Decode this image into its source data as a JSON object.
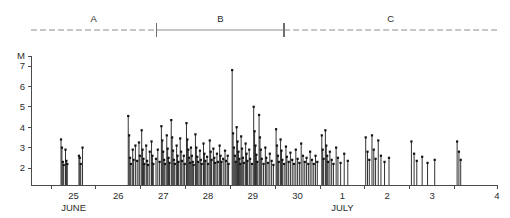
{
  "chart_data": {
    "type": "scatter",
    "title": "",
    "subtitle": "",
    "xlabel": "",
    "ylabel": "M",
    "ylim": [
      1.6,
      7.6
    ],
    "xlim": [
      24.55,
      4.95
    ],
    "grid": false,
    "legend": null,
    "y_ticks": [
      7,
      6,
      5,
      4,
      3,
      2
    ],
    "y_tick_labels": [
      "7",
      "6",
      "5",
      "4",
      "3",
      "2"
    ],
    "x_ticks": [
      25,
      26,
      27,
      28,
      29,
      30,
      1,
      2,
      3,
      4
    ],
    "x_tick_labels": [
      "25",
      "26",
      "27",
      "28",
      "29",
      "30",
      "1",
      "2",
      "3",
      "4"
    ],
    "x_month_labels": [
      {
        "text": "JUNE",
        "at_tick": "25"
      },
      {
        "text": "JULY",
        "at_tick": "1"
      }
    ],
    "annotations": [
      {
        "label": "A",
        "style": "dashed",
        "start_day": 24.55,
        "end_day": 27.35
      },
      {
        "label": "B",
        "style": "solid",
        "start_day": 27.35,
        "end_day": 30.2
      },
      {
        "label": "C",
        "style": "dashed",
        "start_day": 30.2,
        "end_day": 4.95
      }
    ],
    "series": [
      {
        "name": "earthquake magnitudes",
        "marker": "square",
        "stem": true,
        "points": [
          [
            25.22,
            3.4
          ],
          [
            25.24,
            3.0
          ],
          [
            25.26,
            2.3
          ],
          [
            25.28,
            2.15
          ],
          [
            25.32,
            2.9
          ],
          [
            25.34,
            2.35
          ],
          [
            25.36,
            2.2
          ],
          [
            25.62,
            2.6
          ],
          [
            25.64,
            2.5
          ],
          [
            25.66,
            2.2
          ],
          [
            25.7,
            3.0
          ],
          [
            26.72,
            4.55
          ],
          [
            26.74,
            3.6
          ],
          [
            26.76,
            2.5
          ],
          [
            26.78,
            2.2
          ],
          [
            26.82,
            2.9
          ],
          [
            26.84,
            2.4
          ],
          [
            26.88,
            3.1
          ],
          [
            26.92,
            2.35
          ],
          [
            26.96,
            3.25
          ],
          [
            26.98,
            2.6
          ],
          [
            27.02,
            3.85
          ],
          [
            27.04,
            2.9
          ],
          [
            27.06,
            2.45
          ],
          [
            27.08,
            2.2
          ],
          [
            27.12,
            3.1
          ],
          [
            27.14,
            2.35
          ],
          [
            27.16,
            2.15
          ],
          [
            27.2,
            2.8
          ],
          [
            27.24,
            3.3
          ],
          [
            27.26,
            2.6
          ],
          [
            27.28,
            2.2
          ],
          [
            27.34,
            2.45
          ],
          [
            27.38,
            2.9
          ],
          [
            27.42,
            2.3
          ],
          [
            27.46,
            4.05
          ],
          [
            27.48,
            3.35
          ],
          [
            27.5,
            2.8
          ],
          [
            27.52,
            2.4
          ],
          [
            27.54,
            2.2
          ],
          [
            27.58,
            3.6
          ],
          [
            27.6,
            2.95
          ],
          [
            27.62,
            2.5
          ],
          [
            27.64,
            2.25
          ],
          [
            27.68,
            4.35
          ],
          [
            27.7,
            3.5
          ],
          [
            27.72,
            2.85
          ],
          [
            27.74,
            2.4
          ],
          [
            27.76,
            2.2
          ],
          [
            27.8,
            3.1
          ],
          [
            27.82,
            2.6
          ],
          [
            27.84,
            2.3
          ],
          [
            27.88,
            3.45
          ],
          [
            27.9,
            2.8
          ],
          [
            27.92,
            2.35
          ],
          [
            27.96,
            2.6
          ],
          [
            27.98,
            2.2
          ],
          [
            28.02,
            4.2
          ],
          [
            28.04,
            3.4
          ],
          [
            28.06,
            2.9
          ],
          [
            28.08,
            2.5
          ],
          [
            28.1,
            2.25
          ],
          [
            28.12,
            3.0
          ],
          [
            28.14,
            2.6
          ],
          [
            28.16,
            2.3
          ],
          [
            28.18,
            2.15
          ],
          [
            28.22,
            3.65
          ],
          [
            28.24,
            3.0
          ],
          [
            28.26,
            2.55
          ],
          [
            28.28,
            2.3
          ],
          [
            28.32,
            2.85
          ],
          [
            28.34,
            2.4
          ],
          [
            28.36,
            2.2
          ],
          [
            28.4,
            3.2
          ],
          [
            28.42,
            2.7
          ],
          [
            28.44,
            2.35
          ],
          [
            28.48,
            2.55
          ],
          [
            28.5,
            2.2
          ],
          [
            28.54,
            3.35
          ],
          [
            28.56,
            2.8
          ],
          [
            28.58,
            2.4
          ],
          [
            28.62,
            2.95
          ],
          [
            28.64,
            2.5
          ],
          [
            28.66,
            2.25
          ],
          [
            28.7,
            2.7
          ],
          [
            28.72,
            2.3
          ],
          [
            28.76,
            3.1
          ],
          [
            28.78,
            2.6
          ],
          [
            28.8,
            2.3
          ],
          [
            28.84,
            2.45
          ],
          [
            28.88,
            2.85
          ],
          [
            28.9,
            2.35
          ],
          [
            28.94,
            2.6
          ],
          [
            28.96,
            2.2
          ],
          [
            29.04,
            6.8
          ],
          [
            29.06,
            3.7
          ],
          [
            29.08,
            3.0
          ],
          [
            29.1,
            2.6
          ],
          [
            29.12,
            2.3
          ],
          [
            29.14,
            4.0
          ],
          [
            29.16,
            3.3
          ],
          [
            29.18,
            2.8
          ],
          [
            29.2,
            2.45
          ],
          [
            29.22,
            2.2
          ],
          [
            29.24,
            3.55
          ],
          [
            29.26,
            2.95
          ],
          [
            29.28,
            2.5
          ],
          [
            29.3,
            2.25
          ],
          [
            29.34,
            3.2
          ],
          [
            29.36,
            2.7
          ],
          [
            29.38,
            2.35
          ],
          [
            29.42,
            2.9
          ],
          [
            29.44,
            2.45
          ],
          [
            29.48,
            2.2
          ],
          [
            29.52,
            5.0
          ],
          [
            29.54,
            3.8
          ],
          [
            29.56,
            3.1
          ],
          [
            29.58,
            2.65
          ],
          [
            29.6,
            2.3
          ],
          [
            29.64,
            4.6
          ],
          [
            29.66,
            3.5
          ],
          [
            29.68,
            2.9
          ],
          [
            29.7,
            2.45
          ],
          [
            29.74,
            2.2
          ],
          [
            29.78,
            3.0
          ],
          [
            29.8,
            2.5
          ],
          [
            29.84,
            2.25
          ],
          [
            29.88,
            2.7
          ],
          [
            29.92,
            2.35
          ],
          [
            29.96,
            2.15
          ],
          [
            30.02,
            3.9
          ],
          [
            30.04,
            3.1
          ],
          [
            30.06,
            2.6
          ],
          [
            30.08,
            2.3
          ],
          [
            30.12,
            3.4
          ],
          [
            30.14,
            2.85
          ],
          [
            30.16,
            2.4
          ],
          [
            30.2,
            2.2
          ],
          [
            30.24,
            3.05
          ],
          [
            30.26,
            2.55
          ],
          [
            30.3,
            2.3
          ],
          [
            30.34,
            2.75
          ],
          [
            30.38,
            2.4
          ],
          [
            30.42,
            2.2
          ],
          [
            30.46,
            2.9
          ],
          [
            30.5,
            2.45
          ],
          [
            30.54,
            2.25
          ],
          [
            30.58,
            3.2
          ],
          [
            30.62,
            2.6
          ],
          [
            30.66,
            2.3
          ],
          [
            30.7,
            2.5
          ],
          [
            30.74,
            2.2
          ],
          [
            30.78,
            2.8
          ],
          [
            30.82,
            2.4
          ],
          [
            30.86,
            2.2
          ],
          [
            30.9,
            2.6
          ],
          [
            30.94,
            2.3
          ],
          [
            1.04,
            3.6
          ],
          [
            1.06,
            2.9
          ],
          [
            1.08,
            2.45
          ],
          [
            1.12,
            3.85
          ],
          [
            1.14,
            3.1
          ],
          [
            1.16,
            2.6
          ],
          [
            1.18,
            2.3
          ],
          [
            1.22,
            2.8
          ],
          [
            1.26,
            2.4
          ],
          [
            1.3,
            2.2
          ],
          [
            1.36,
            3.0
          ],
          [
            1.4,
            2.5
          ],
          [
            1.46,
            2.25
          ],
          [
            1.54,
            2.7
          ],
          [
            1.62,
            2.35
          ],
          [
            2.02,
            3.5
          ],
          [
            2.06,
            2.8
          ],
          [
            2.1,
            2.4
          ],
          [
            2.16,
            3.6
          ],
          [
            2.2,
            2.9
          ],
          [
            2.24,
            2.45
          ],
          [
            2.3,
            3.35
          ],
          [
            2.36,
            2.6
          ],
          [
            2.44,
            2.3
          ],
          [
            2.54,
            2.5
          ],
          [
            3.04,
            3.3
          ],
          [
            3.1,
            2.7
          ],
          [
            3.16,
            2.35
          ],
          [
            3.28,
            2.55
          ],
          [
            3.4,
            2.25
          ],
          [
            3.56,
            2.4
          ],
          [
            4.06,
            3.3
          ],
          [
            4.1,
            2.8
          ],
          [
            4.14,
            2.4
          ]
        ]
      }
    ]
  },
  "axis": {
    "y_title": "M"
  }
}
